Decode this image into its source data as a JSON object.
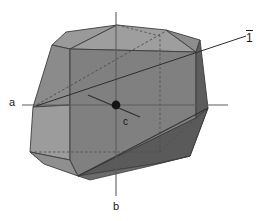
{
  "figure": {
    "type": "crystallographic-habit-diagram",
    "background_color": "#ffffff"
  },
  "labels": {
    "axis_a": "a",
    "axis_b": "b",
    "axis_c": "c",
    "inversion_center": "1",
    "inversion_center_overbar": true
  },
  "colors": {
    "face_front": "#808080",
    "face_top": "#9c9c9c",
    "face_top_left": "#8e8e8e",
    "face_left_upper": "#8a8a8a",
    "face_left_lower": "#9c9c9c",
    "face_right_dark": "#5c5c5c",
    "face_bottom_dark": "#5a5a5a",
    "face_right_mid": "#6e6e6e",
    "edge": "#3c3c3c",
    "hidden_edge": "#4a4a4a",
    "axis_line": "#5a5a5a",
    "center_dot": "#141414",
    "text": "#1a1a1a"
  },
  "geometry": {
    "center_point": {
      "x": 116,
      "y": 105
    },
    "axes": [
      {
        "name": "a",
        "from": {
          "x": 22,
          "y": 105
        },
        "to": {
          "x": 228,
          "y": 105
        }
      },
      {
        "name": "b",
        "from": {
          "x": 116,
          "y": 12
        },
        "to": {
          "x": 116,
          "y": 196
        }
      },
      {
        "name": "inversion-ray",
        "from": {
          "x": 33,
          "y": 107
        },
        "to": {
          "x": 246,
          "y": 36
        }
      },
      {
        "name": "c-short",
        "from": {
          "x": 90,
          "y": 96
        },
        "to": {
          "x": 140,
          "y": 116
        }
      }
    ]
  }
}
